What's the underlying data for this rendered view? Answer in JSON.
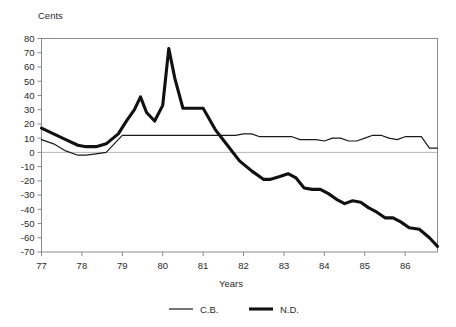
{
  "chart_data": {
    "type": "line",
    "title": "",
    "xlabel": "Years",
    "ylabel": "Cents",
    "ylim": [
      -70,
      80
    ],
    "xlim": [
      77,
      86.8
    ],
    "grid": false,
    "zero_line": true,
    "legend_position": "bottom-center",
    "y_ticks": [
      80,
      70,
      60,
      50,
      40,
      30,
      20,
      10,
      0,
      -10,
      -20,
      -30,
      -40,
      -50,
      -60,
      -70
    ],
    "y_tick_labels": [
      "80",
      "70",
      "60",
      "50",
      "40",
      "30",
      "20",
      "10",
      "0",
      "-10",
      "-20",
      "-30",
      "-40",
      "-50",
      "-60",
      "-70"
    ],
    "x_ticks": [
      77,
      78,
      79,
      80,
      81,
      82,
      83,
      84,
      85,
      86
    ],
    "x_tick_labels": [
      "77",
      "78",
      "79",
      "80",
      "81",
      "82",
      "83",
      "84",
      "85",
      "86"
    ],
    "series": [
      {
        "name": "C.B.",
        "legend_label": "C.B.",
        "style": "thin",
        "color": "#1a1a1a",
        "x": [
          77.0,
          77.3,
          77.6,
          77.9,
          78.1,
          78.35,
          78.6,
          78.8,
          79.0,
          79.3,
          79.7,
          80.0,
          80.4,
          80.8,
          81.2,
          81.5,
          81.8,
          82.0,
          82.2,
          82.4,
          82.6,
          82.8,
          83.0,
          83.2,
          83.4,
          83.6,
          83.8,
          84.0,
          84.2,
          84.4,
          84.6,
          84.8,
          85.0,
          85.2,
          85.4,
          85.6,
          85.8,
          86.0,
          86.2,
          86.4,
          86.6,
          86.8
        ],
        "y": [
          9,
          6,
          1,
          -2,
          -2,
          -1,
          0,
          6,
          12,
          12,
          12,
          12,
          12,
          12,
          12,
          12,
          12,
          13,
          13,
          11,
          11,
          11,
          11,
          11,
          9,
          9,
          9,
          8,
          10,
          10,
          8,
          8,
          10,
          12,
          12,
          10,
          9,
          11,
          11,
          11,
          3,
          3
        ]
      },
      {
        "name": "N.D.",
        "legend_label": "N.D.",
        "style": "thick",
        "color": "#111111",
        "x": [
          77.0,
          77.3,
          77.6,
          77.9,
          78.1,
          78.35,
          78.6,
          78.9,
          79.1,
          79.3,
          79.45,
          79.6,
          79.8,
          80.0,
          80.15,
          80.3,
          80.5,
          80.75,
          81.0,
          81.3,
          81.6,
          81.9,
          82.2,
          82.5,
          82.65,
          82.9,
          83.1,
          83.3,
          83.5,
          83.7,
          83.9,
          84.1,
          84.3,
          84.5,
          84.7,
          84.9,
          85.1,
          85.3,
          85.5,
          85.7,
          85.9,
          86.1,
          86.35,
          86.6,
          86.8
        ],
        "y": [
          17,
          13,
          9,
          5,
          4,
          4,
          6,
          13,
          22,
          30,
          39,
          28,
          22,
          33,
          73,
          52,
          31,
          31,
          31,
          16,
          5,
          -6,
          -13,
          -19,
          -19,
          -17,
          -15,
          -18,
          -25,
          -26,
          -26,
          -29,
          -33,
          -36,
          -34,
          -35,
          -39,
          -42,
          -46,
          -46,
          -49,
          -53,
          -54,
          -60,
          -66
        ]
      }
    ]
  }
}
